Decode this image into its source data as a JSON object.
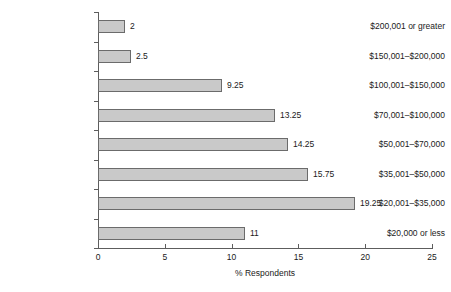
{
  "chart_data": {
    "type": "bar",
    "orientation": "horizontal",
    "title": "",
    "xlabel": "% Respondents",
    "ylabel": "",
    "xlim": [
      0,
      25
    ],
    "xticks": [
      0,
      5,
      10,
      15,
      20,
      25
    ],
    "xtick_labels": [
      "0",
      "5",
      "10",
      "15",
      "20",
      "25"
    ],
    "grid": false,
    "legend": null,
    "bar_fill_color": "#c9c9c9",
    "bar_edge_color": "#6b6b6b",
    "axis_color": "#5d5d5d",
    "categories": [
      "$200,001 or greater",
      "$150,001–$200,000",
      "$100,001–$150,000",
      "$70,001–$100,000",
      "$50,001–$70,000",
      "$35,001–$50,000",
      "$20,001–$35,000",
      "$20,000 or less"
    ],
    "values": [
      2,
      2.5,
      9.25,
      13.25,
      14.25,
      15.75,
      19.25,
      11
    ],
    "value_labels": [
      "2",
      "2.5",
      "9.25",
      "13.25",
      "14.25",
      "15.75",
      "19.25",
      "11"
    ]
  }
}
